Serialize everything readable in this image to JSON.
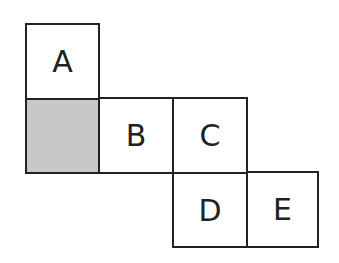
{
  "diagram": {
    "type": "cube-net",
    "cells": [
      {
        "id": "A",
        "label": "A",
        "row": 0,
        "col": 0,
        "shaded": false
      },
      {
        "id": "shaded",
        "label": "",
        "row": 1,
        "col": 0,
        "shaded": true
      },
      {
        "id": "B",
        "label": "B",
        "row": 1,
        "col": 1,
        "shaded": false
      },
      {
        "id": "C",
        "label": "C",
        "row": 1,
        "col": 2,
        "shaded": false
      },
      {
        "id": "D",
        "label": "D",
        "row": 2,
        "col": 2,
        "shaded": false
      },
      {
        "id": "E",
        "label": "E",
        "row": 2,
        "col": 3,
        "shaded": false
      }
    ],
    "colors": {
      "border": "#222222",
      "shade": "#c8c8c8"
    }
  }
}
